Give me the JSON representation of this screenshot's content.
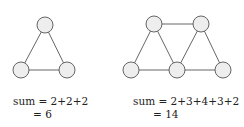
{
  "figures": [
    {
      "name": "triangle",
      "nodes": [
        {
          "id": "a",
          "x": 45,
          "y": 25
        },
        {
          "id": "b",
          "x": 21,
          "y": 70
        },
        {
          "id": "c",
          "x": 67,
          "y": 70
        }
      ],
      "edges": [
        [
          "a",
          "b"
        ],
        [
          "a",
          "c"
        ],
        [
          "b",
          "c"
        ]
      ],
      "equation_line1": "sum = 2+2+2",
      "equation_line2": "= 6"
    },
    {
      "name": "two-triangles",
      "nodes": [
        {
          "id": "p",
          "x": 154,
          "y": 24
        },
        {
          "id": "q",
          "x": 201,
          "y": 24
        },
        {
          "id": "r",
          "x": 131,
          "y": 70
        },
        {
          "id": "s",
          "x": 177,
          "y": 70
        },
        {
          "id": "t",
          "x": 223,
          "y": 70
        }
      ],
      "edges": [
        [
          "p",
          "q"
        ],
        [
          "p",
          "r"
        ],
        [
          "p",
          "s"
        ],
        [
          "q",
          "s"
        ],
        [
          "q",
          "t"
        ],
        [
          "r",
          "s"
        ],
        [
          "s",
          "t"
        ]
      ],
      "equation_line1": "sum = 2+3+4+3+2",
      "equation_line2": "= 14"
    }
  ],
  "style": {
    "node_radius": 8,
    "node_fill": "#eeeeee",
    "stroke": "#555555"
  }
}
